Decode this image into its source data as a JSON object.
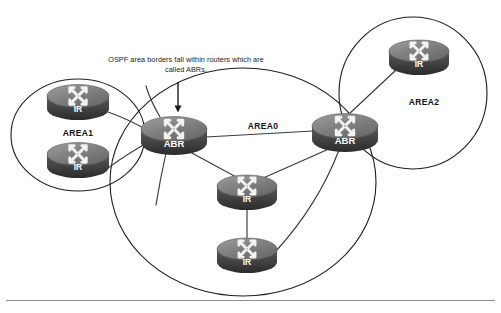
{
  "diagram": {
    "background_color": "#ffffff",
    "callout": {
      "line1": "OSPF area borders fall within routers which are",
      "line2": "called ABRs.",
      "arrow_name": "down-arrow-icon"
    },
    "areas": [
      {
        "id": "area1",
        "label": "AREA1",
        "cx": 78,
        "cy": 135,
        "rx": 67,
        "ry": 56,
        "label_x": 78,
        "label_y": 134
      },
      {
        "id": "area0",
        "label": "AREA0",
        "cx": 243,
        "cy": 182,
        "rx": 133,
        "ry": 114,
        "label_x": 263,
        "label_y": 127
      },
      {
        "id": "area2",
        "label": "AREA2",
        "cx": 413,
        "cy": 93,
        "rx": 74,
        "ry": 76,
        "label_x": 424,
        "label_y": 103
      }
    ],
    "routers": [
      {
        "id": "ir-area1-top",
        "label": "IR",
        "x": 78,
        "y": 101,
        "w": 62,
        "h": 36,
        "area": "AREA1"
      },
      {
        "id": "ir-area1-bottom",
        "label": "IR",
        "x": 78,
        "y": 159,
        "w": 62,
        "h": 36,
        "area": "AREA1"
      },
      {
        "id": "abr-left",
        "label": "ABR",
        "x": 174,
        "y": 134,
        "w": 66,
        "h": 38,
        "area": "AREA0/AREA1 border"
      },
      {
        "id": "abr-right",
        "label": "ABR",
        "x": 345,
        "y": 131,
        "w": 66,
        "h": 38,
        "area": "AREA0/AREA2 border"
      },
      {
        "id": "ir-area0-mid",
        "label": "IR",
        "x": 247,
        "y": 191,
        "w": 60,
        "h": 35,
        "area": "AREA0"
      },
      {
        "id": "ir-area0-bottom",
        "label": "IR",
        "x": 247,
        "y": 254,
        "w": 60,
        "h": 35,
        "area": "AREA0"
      },
      {
        "id": "ir-area2",
        "label": "IR",
        "x": 419,
        "y": 56,
        "w": 60,
        "h": 35,
        "area": "AREA2"
      }
    ],
    "links": [
      {
        "id": "link-ir1top-abrleft",
        "from": "ir-area1-top",
        "to": "abr-left"
      },
      {
        "id": "link-ir1bot-abrleft",
        "from": "ir-area1-bottom",
        "to": "abr-left"
      },
      {
        "id": "link-abrleft-abrright",
        "from": "abr-left",
        "to": "abr-right"
      },
      {
        "id": "link-abrleft-irmid",
        "from": "abr-left",
        "to": "ir-area0-mid"
      },
      {
        "id": "link-abrright-irmid",
        "from": "abr-right",
        "to": "ir-area0-mid"
      },
      {
        "id": "link-irmid-irbottom",
        "from": "ir-area0-mid",
        "to": "ir-area0-bottom"
      },
      {
        "id": "link-abrright-irbottom",
        "from": "abr-right",
        "to": "ir-area0-bottom"
      },
      {
        "id": "link-abrright-ir2",
        "from": "abr-right",
        "to": "ir-area2"
      }
    ],
    "colors": {
      "router_top": "#8a8a8a",
      "router_top_edge": "#5c5c5c",
      "router_body": "#4a4a4a",
      "router_body_dark": "#333333",
      "arrow_white": "#f2f2f2",
      "line": "#3a3a3a",
      "ellipse": "#1d1d1d",
      "text": "#121212",
      "divider": "#8d8d8d"
    }
  }
}
